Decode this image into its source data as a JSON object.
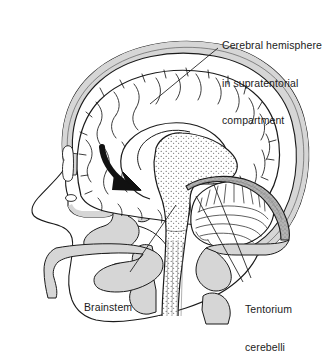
{
  "figure": {
    "name": "midsagittal-head-anatomy",
    "background_color": "#ffffff",
    "ink_color": "#1b1b1b",
    "shade_color": "#d0d0d0",
    "tentorium_color": "#9a9a9a"
  },
  "labels": {
    "cerebral_hemisphere": {
      "line1": "Cerebral hemisphere",
      "line2": "in supratentorial",
      "line3": "compartment"
    },
    "brainstem": {
      "line1": "Brainstem"
    },
    "tentorium": {
      "line1": "Tentorium",
      "line2": "cerebelli"
    }
  },
  "leader_lines": [
    {
      "name": "leader-cerebral-hemisphere",
      "from": [
        218,
        48
      ],
      "to": [
        150,
        104
      ]
    },
    {
      "name": "leader-brainstem",
      "from": [
        130,
        272
      ],
      "to": [
        176,
        205
      ]
    },
    {
      "name": "leader-tentorium-a",
      "from": [
        243,
        282
      ],
      "to": [
        196,
        196
      ]
    },
    {
      "name": "leader-tentorium-b",
      "from": [
        251,
        278
      ],
      "to": [
        214,
        185
      ]
    }
  ],
  "structures": [
    {
      "name": "skull-vault",
      "fill": "shade"
    },
    {
      "name": "facial-profile",
      "fill": "none"
    },
    {
      "name": "cerebral-hemisphere",
      "fill": "none"
    },
    {
      "name": "corpus-callosum",
      "fill": "none"
    },
    {
      "name": "brainstem",
      "fill": "stipple"
    },
    {
      "name": "cerebellum",
      "fill": "none"
    },
    {
      "name": "tentorium-cerebelli",
      "fill": "tentorium"
    },
    {
      "name": "sphenoid-bone",
      "fill": "shade"
    },
    {
      "name": "hard-palate-mandible",
      "fill": "shade"
    },
    {
      "name": "cervical-vertebrae",
      "fill": "shade"
    },
    {
      "name": "herniation-arrow",
      "fill": "ink"
    }
  ]
}
